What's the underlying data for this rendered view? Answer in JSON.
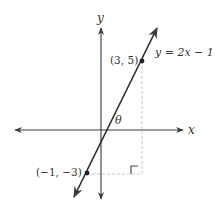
{
  "diagram": {
    "axes": {
      "x_label": "x",
      "y_label": "y"
    },
    "line": {
      "equation_label": "y = 2x − 1",
      "slope": 2,
      "intercept": -1
    },
    "points": [
      {
        "label": "(3, 5)",
        "x": 3,
        "y": 5
      },
      {
        "label": "(−1, −3)",
        "x": -1,
        "y": -3
      }
    ],
    "angle_label": "θ",
    "right_angle_marker": true,
    "colors": {
      "line": "#2b2b2b",
      "axes": "#3a3a3a",
      "dashed": "#c8c8c8",
      "text": "#333333"
    }
  }
}
